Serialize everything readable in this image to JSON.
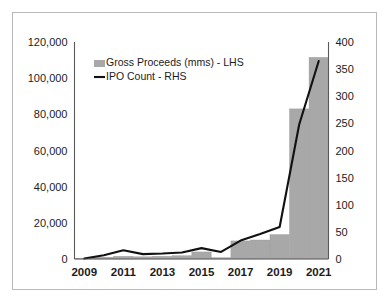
{
  "chart_data": {
    "type": "bar",
    "title": "",
    "subtitle": "",
    "xlabel": "",
    "ylabel": "",
    "grid": false,
    "legend_position": "inside-top-left",
    "categories": [
      "2009",
      "2010",
      "2011",
      "2012",
      "2013",
      "2014",
      "2015",
      "2016",
      "2017",
      "2018",
      "2019",
      "2020",
      "2021"
    ],
    "x_tick_labels": [
      "2009",
      "2011",
      "2013",
      "2015",
      "2017",
      "2019",
      "2021"
    ],
    "axes": {
      "left": {
        "label": "Gross Proceeds (mms)",
        "ylim": [
          0,
          120000
        ],
        "ticks": [
          0,
          20000,
          40000,
          60000,
          80000,
          100000,
          120000
        ],
        "tick_labels": [
          "0",
          "20,000",
          "40,000",
          "60,000",
          "80,000",
          "100,000",
          "120,000"
        ]
      },
      "right": {
        "label": "IPO Count",
        "ylim": [
          0,
          400
        ],
        "ticks": [
          0,
          50,
          100,
          150,
          200,
          250,
          300,
          350,
          400
        ],
        "tick_labels": [
          "0",
          "50",
          "100",
          "150",
          "200",
          "250",
          "300",
          "350",
          "400"
        ]
      }
    },
    "series": [
      {
        "name": "Gross Proceeds (mms) - LHS",
        "type": "bar",
        "axis": "left",
        "color": "#a8a8a8",
        "values": [
          400,
          1000,
          1500,
          1200,
          1500,
          1800,
          3900,
          700,
          10000,
          10500,
          13500,
          83000,
          111500
        ]
      },
      {
        "name": "IPO Count - RHS",
        "type": "line",
        "axis": "right",
        "color": "#111111",
        "values": [
          1,
          7,
          16,
          9,
          10,
          12,
          20,
          13,
          34,
          46,
          59,
          248,
          365
        ]
      }
    ],
    "legend": [
      {
        "label": "Gross Proceeds (mms) - LHS",
        "marker": "square",
        "color": "#a8a8a8"
      },
      {
        "label": "IPO Count - RHS",
        "marker": "line",
        "color": "#111111"
      }
    ]
  }
}
